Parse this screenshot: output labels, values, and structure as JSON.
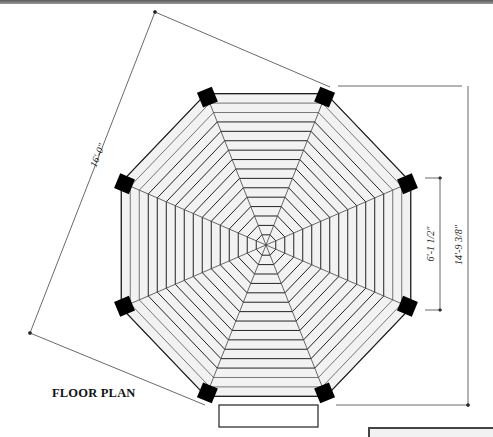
{
  "drawing": {
    "title": "FLOOR PLAN",
    "dimensions": {
      "diagonal_overall": "16'-0\"",
      "overall_height": "14'-9 3/8\"",
      "side_length": "6'-1 1/2\""
    },
    "shape": "octagon",
    "board_rings": 15,
    "colors": {
      "line": "#222222",
      "post": "#000000",
      "board_fill": "#f2f2f2",
      "background": "#ffffff"
    }
  }
}
